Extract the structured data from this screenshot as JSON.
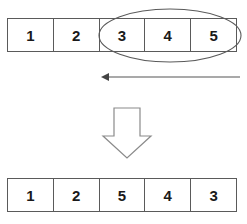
{
  "diagram": {
    "stroke_color": "#5a5a5a",
    "text_color": "#1a1a1a",
    "background_color": "#ffffff",
    "before_row": {
      "name": "before-array",
      "cells": [
        {
          "label": "1",
          "highlighted": false
        },
        {
          "label": "2",
          "highlighted": false
        },
        {
          "label": "3",
          "highlighted": true
        },
        {
          "label": "4",
          "highlighted": true
        },
        {
          "label": "5",
          "highlighted": true
        }
      ]
    },
    "after_row": {
      "name": "after-array",
      "cells": [
        {
          "label": "1"
        },
        {
          "label": "2"
        },
        {
          "label": "5"
        },
        {
          "label": "4"
        },
        {
          "label": "3"
        }
      ]
    },
    "selection_ellipse": {
      "name": "selection-ellipse",
      "covers": [
        "3",
        "4",
        "5"
      ],
      "cx": 170,
      "cy": 35.5,
      "rx": 71,
      "ry": 26.5
    },
    "reverse_arrow": {
      "name": "reverse-direction-arrow",
      "direction": "left",
      "from_x": 240,
      "to_x": 101,
      "y": 77
    },
    "transform_arrow": {
      "name": "transform-down-arrow",
      "direction": "down"
    }
  }
}
